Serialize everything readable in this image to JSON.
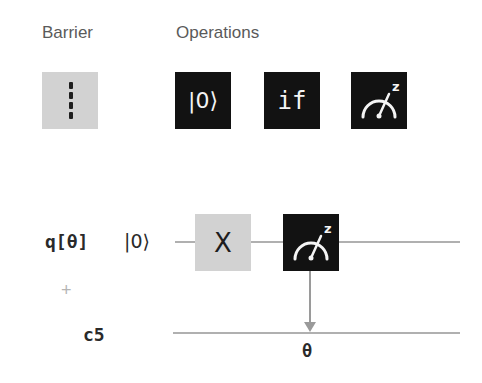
{
  "palette": {
    "sections": [
      {
        "title": "Barrier",
        "items": [
          {
            "id": "barrier",
            "icon": "barrier-icon"
          }
        ]
      },
      {
        "title": "Operations",
        "items": [
          {
            "id": "reset",
            "label": "|0⟩",
            "icon": "reset-icon"
          },
          {
            "id": "if",
            "label": "if",
            "icon": "if-icon"
          },
          {
            "id": "measure",
            "label": "z",
            "icon": "measure-z-icon"
          }
        ]
      }
    ]
  },
  "circuit": {
    "qubits": [
      {
        "name": "q[θ]",
        "init": "|0⟩"
      }
    ],
    "add_register_symbol": "+",
    "classical": [
      {
        "name": "c5"
      }
    ],
    "gates": [
      {
        "type": "X",
        "label": "X"
      },
      {
        "type": "measure",
        "basis": "z",
        "target_bit_label": "θ"
      }
    ]
  },
  "colors": {
    "dark_tile": "#121212",
    "light_tile": "#d2d2d2",
    "wire": "#b0b0b0"
  }
}
